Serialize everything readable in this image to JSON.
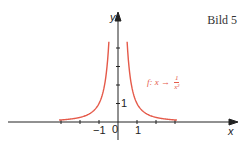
{
  "title": "Bild 5",
  "chart_data": {
    "type": "line",
    "title": "Bild 5",
    "xlabel": "x",
    "ylabel": "y",
    "function": "f: x → 1/x²",
    "annotation": {
      "prefix": "f: x →",
      "numerator": "1",
      "denominator": "x²"
    },
    "tick_labels": {
      "x": [
        "−1",
        "0",
        "1"
      ],
      "y": [
        "1"
      ]
    },
    "xlim": [
      -5.5,
      6.5
    ],
    "ylim": [
      -1,
      4.2
    ],
    "grid": false,
    "series": [
      {
        "name": "f(x)=1/x² (x<0)",
        "color": "#e55a4a",
        "x": [
          -3,
          -2.5,
          -2,
          -1.5,
          -1,
          -0.8,
          -0.7,
          -0.6,
          -0.5
        ],
        "y": [
          0.11,
          0.16,
          0.25,
          0.44,
          1,
          1.56,
          2.04,
          2.78,
          4
        ]
      },
      {
        "name": "f(x)=1/x² (x>0)",
        "color": "#e55a4a",
        "x": [
          0.5,
          0.6,
          0.7,
          0.8,
          1,
          1.5,
          2,
          2.5,
          3
        ],
        "y": [
          4,
          2.78,
          2.04,
          1.56,
          1,
          0.44,
          0.25,
          0.16,
          0.11
        ]
      }
    ]
  },
  "labels": {
    "x_axis": "x",
    "y_axis": "y",
    "origin": "0",
    "x_neg1": "−1",
    "x_pos1": "1",
    "y_pos1": "1"
  }
}
